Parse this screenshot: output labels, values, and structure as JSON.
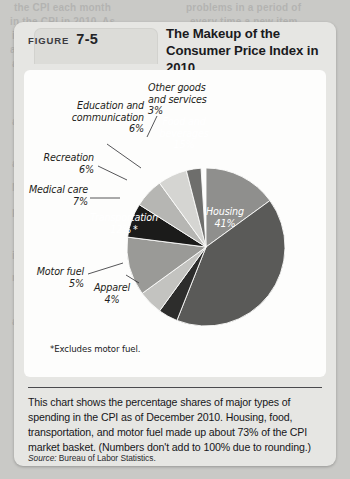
{
  "figure": {
    "tab_word": "FIGURE",
    "tab_number": "7-5",
    "title": "The Makeup of the Consumer Price Index in 2010"
  },
  "footnote": "*Excludes motor fuel.",
  "caption": {
    "body": "This chart shows the percentage shares of major types of spending in the CPI as of December 2010. Housing, food, transportation, and motor fuel made up about 73% of the CPI market basket. (Numbers don't add to 100% due to rounding.)",
    "source_label": "Source:",
    "source_text": " Bureau of Labor Statistics."
  },
  "labels": {
    "education": "Education and",
    "education2": "communication",
    "education_pct": "6%",
    "other_goods": "Other goods",
    "other_goods2": "and services",
    "other_goods_pct": "3%",
    "recreation": "Recreation",
    "recreation_pct": "6%",
    "medical": "Medical care",
    "medical_pct": "7%",
    "food": "Food and",
    "food2": "beverages",
    "food_pct": "15%",
    "housing": "Housing",
    "housing_pct": "41%",
    "transportation": "Transportation",
    "transportation_pct": "12% *",
    "motor_fuel": "Motor fuel",
    "motor_fuel_pct": "5%",
    "apparel": "Apparel",
    "apparel_pct": "4%"
  },
  "bleed_text": [
    {
      "t": "the CPI each month",
      "x": 14,
      "y": 2
    },
    {
      "t": "problems in a period of",
      "x": 186,
      "y": 2
    },
    {
      "t": "in the CPI in 2010. As",
      "x": 10,
      "y": 16
    },
    {
      "t": "every time a new item",
      "x": 190,
      "y": 16
    },
    {
      "t": "in the index",
      "x": 12,
      "y": 30
    },
    {
      "t": "a change in quality",
      "x": 188,
      "y": 30
    },
    {
      "t": "and of transportation",
      "x": 10,
      "y": 44
    },
    {
      "t": "the item is bought",
      "x": 190,
      "y": 46
    },
    {
      "t": "and food in a Depart-",
      "x": 12,
      "y": 58
    },
    {
      "t": "in a supermarket",
      "x": 188,
      "y": 60
    },
    {
      "t": "ment cost",
      "x": 14,
      "y": 74
    },
    {
      "t": "are often",
      "x": 12,
      "y": 116
    },
    {
      "t": "reflects",
      "x": 14,
      "y": 136
    },
    {
      "t": "a bundle",
      "x": 12,
      "y": 158
    },
    {
      "t": "NOT in",
      "x": 12,
      "y": 182
    },
    {
      "t": "problem",
      "x": 12,
      "y": 206
    },
    {
      "t": "quality",
      "x": 14,
      "y": 228
    },
    {
      "t": "if a new",
      "x": 12,
      "y": 250
    },
    {
      "t": "measure",
      "x": 12,
      "y": 272
    },
    {
      "t": "of living",
      "x": 14,
      "y": 294
    },
    {
      "t": "adjusts",
      "x": 12,
      "y": 316
    },
    {
      "t": "for it",
      "x": 14,
      "y": 338
    }
  ],
  "chart_data": {
    "type": "pie",
    "title": "The Makeup of the Consumer Price Index in 2010",
    "unit": "percent share of CPI market basket",
    "legend_position": "none (labels on/around slices)",
    "note": "*Excludes motor fuel. Numbers don't add to 100% due to rounding.",
    "categories": [
      "Housing",
      "Food and beverages",
      "Other goods and services",
      "Education and communication",
      "Recreation",
      "Medical care",
      "Transportation",
      "Motor fuel",
      "Apparel"
    ],
    "values": [
      41,
      15,
      3,
      6,
      6,
      7,
      12,
      5,
      4
    ],
    "slices": [
      {
        "label": "Food and beverages",
        "value": 15,
        "display": "15%",
        "color": "#8f8f8d",
        "start_deg": 0,
        "end_deg": 54
      },
      {
        "label": "Housing",
        "value": 41,
        "display": "41%",
        "color": "#5a5a58",
        "start_deg": 54,
        "end_deg": 201.6
      },
      {
        "label": "Apparel",
        "value": 4,
        "display": "4%",
        "color": "#2d2d2c",
        "start_deg": 201.6,
        "end_deg": 216
      },
      {
        "label": "Motor fuel",
        "value": 5,
        "display": "5%",
        "color": "#c3c3c0",
        "start_deg": 216,
        "end_deg": 234
      },
      {
        "label": "Transportation",
        "value": 12,
        "display": "12%*",
        "color": "#9a9a97",
        "start_deg": 234,
        "end_deg": 277.2
      },
      {
        "label": "Medical care",
        "value": 7,
        "display": "7%",
        "color": "#1b1b1a",
        "start_deg": 277.2,
        "end_deg": 302.4
      },
      {
        "label": "Recreation",
        "value": 6,
        "display": "6%",
        "color": "#b6b6b3",
        "start_deg": 302.4,
        "end_deg": 324
      },
      {
        "label": "Education and communication",
        "value": 6,
        "display": "6%",
        "color": "#d5d5d2",
        "start_deg": 324,
        "end_deg": 345.6
      },
      {
        "label": "Other goods and services",
        "value": 3,
        "display": "3%",
        "color": "#6e6e6c",
        "start_deg": 345.6,
        "end_deg": 356.4
      }
    ]
  }
}
